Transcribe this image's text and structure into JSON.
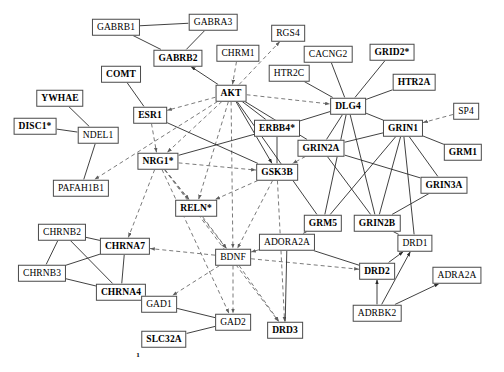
{
  "diagram": {
    "background": "#ffffff",
    "node_border_color": "#4a4a4a",
    "solid_edge_color": "#2b2b2b",
    "dashed_edge_color": "#6b6b6b",
    "annotation": "1",
    "annotation_x": 138,
    "annotation_y": 355
  },
  "nodes": [
    {
      "id": "GABRB1",
      "label": "GABRB1",
      "x": 116,
      "y": 27,
      "bold": false
    },
    {
      "id": "GABRA3",
      "label": "GABRA3",
      "x": 213,
      "y": 22,
      "bold": false
    },
    {
      "id": "RGS4",
      "label": "RGS4",
      "x": 288,
      "y": 33,
      "bold": false
    },
    {
      "id": "GABRB2",
      "label": "GABRB2",
      "x": 178,
      "y": 58,
      "bold": true
    },
    {
      "id": "CHRM1",
      "label": "CHRM1",
      "x": 238,
      "y": 53,
      "bold": false
    },
    {
      "id": "CACNG2",
      "label": "CACNG2",
      "x": 328,
      "y": 54,
      "bold": false
    },
    {
      "id": "GRID2",
      "label": "GRID2*",
      "x": 392,
      "y": 52,
      "bold": true
    },
    {
      "id": "COMT",
      "label": "COMT",
      "x": 121,
      "y": 74,
      "bold": true
    },
    {
      "id": "HTR2C",
      "label": "HTR2C",
      "x": 289,
      "y": 73,
      "bold": false
    },
    {
      "id": "HTR2A",
      "label": "HTR2A",
      "x": 414,
      "y": 82,
      "bold": true
    },
    {
      "id": "YWHAE",
      "label": "YWHAE",
      "x": 60,
      "y": 98,
      "bold": true
    },
    {
      "id": "AKT",
      "label": "AKT",
      "x": 231,
      "y": 93,
      "bold": true
    },
    {
      "id": "DLG4",
      "label": "DLG4",
      "x": 348,
      "y": 106,
      "bold": true
    },
    {
      "id": "SP4",
      "label": "SP4",
      "x": 466,
      "y": 111,
      "bold": false
    },
    {
      "id": "ESR1",
      "label": "ESR1",
      "x": 150,
      "y": 115,
      "bold": true
    },
    {
      "id": "ERBB4",
      "label": "ERBB4*",
      "x": 277,
      "y": 128,
      "bold": true
    },
    {
      "id": "GRIN1",
      "label": "GRIN1",
      "x": 403,
      "y": 128,
      "bold": true
    },
    {
      "id": "DISC1",
      "label": "DISC1*",
      "x": 35,
      "y": 126,
      "bold": true
    },
    {
      "id": "NDEL1",
      "label": "NDEL1",
      "x": 98,
      "y": 135,
      "bold": false
    },
    {
      "id": "GRIN2A",
      "label": "GRIN2A",
      "x": 321,
      "y": 148,
      "bold": true
    },
    {
      "id": "GRM1",
      "label": "GRM1",
      "x": 463,
      "y": 152,
      "bold": true
    },
    {
      "id": "NRG1",
      "label": "NRG1*",
      "x": 158,
      "y": 161,
      "bold": true
    },
    {
      "id": "GSK3B",
      "label": "GSK3B",
      "x": 277,
      "y": 172,
      "bold": true
    },
    {
      "id": "GRIN3A",
      "label": "GRIN3A",
      "x": 444,
      "y": 185,
      "bold": true
    },
    {
      "id": "PAFAH1B1",
      "label": "PAFAH1B1",
      "x": 81,
      "y": 188,
      "bold": false
    },
    {
      "id": "RELN",
      "label": "RELN*",
      "x": 196,
      "y": 208,
      "bold": true
    },
    {
      "id": "GRM5",
      "label": "GRM5",
      "x": 323,
      "y": 223,
      "bold": true
    },
    {
      "id": "GRIN2B",
      "label": "GRIN2B",
      "x": 377,
      "y": 223,
      "bold": true
    },
    {
      "id": "CHRNB2",
      "label": "CHRNB2",
      "x": 62,
      "y": 232,
      "bold": false
    },
    {
      "id": "ADORA2A",
      "label": "ADORA2A",
      "x": 287,
      "y": 242,
      "bold": false
    },
    {
      "id": "DRD1",
      "label": "DRD1",
      "x": 415,
      "y": 243,
      "bold": false
    },
    {
      "id": "CHRNA7",
      "label": "CHRNA7",
      "x": 125,
      "y": 246,
      "bold": true
    },
    {
      "id": "BDNF",
      "label": "BDNF",
      "x": 233,
      "y": 257,
      "bold": false
    },
    {
      "id": "CHRNB3",
      "label": "CHRNB3",
      "x": 42,
      "y": 273,
      "bold": false
    },
    {
      "id": "DRD2",
      "label": "DRD2",
      "x": 377,
      "y": 271,
      "bold": true
    },
    {
      "id": "ADRA2A",
      "label": "ADRA2A",
      "x": 457,
      "y": 275,
      "bold": false
    },
    {
      "id": "CHRNA4",
      "label": "CHRNA4",
      "x": 121,
      "y": 292,
      "bold": true
    },
    {
      "id": "GAD1",
      "label": "GAD1",
      "x": 159,
      "y": 304,
      "bold": false
    },
    {
      "id": "ADRBK2",
      "label": "ADRBK2",
      "x": 377,
      "y": 313,
      "bold": false
    },
    {
      "id": "GAD2",
      "label": "GAD2",
      "x": 233,
      "y": 322,
      "bold": false
    },
    {
      "id": "DRD3",
      "label": "DRD3",
      "x": 285,
      "y": 330,
      "bold": true
    },
    {
      "id": "SLC32A",
      "label": "SLC32A",
      "x": 164,
      "y": 339,
      "bold": true
    }
  ],
  "edges": [
    {
      "from": "GABRB1",
      "to": "GABRA3",
      "style": "solid",
      "arrow": "none"
    },
    {
      "from": "GABRB1",
      "to": "GABRB2",
      "style": "solid",
      "arrow": "none"
    },
    {
      "from": "GABRA3",
      "to": "GABRB2",
      "style": "solid",
      "arrow": "none"
    },
    {
      "from": "AKT",
      "to": "GABRB2",
      "style": "solid",
      "arrow": "to"
    },
    {
      "from": "CHRM1",
      "to": "AKT",
      "style": "dashed",
      "arrow": "to"
    },
    {
      "from": "AKT",
      "to": "RGS4",
      "style": "dashed",
      "arrow": "to"
    },
    {
      "from": "COMT",
      "to": "ESR1",
      "style": "solid",
      "arrow": "none"
    },
    {
      "from": "AKT",
      "to": "ESR1",
      "style": "dashed",
      "arrow": "to"
    },
    {
      "from": "AKT",
      "to": "DLG4",
      "style": "dashed",
      "arrow": "to"
    },
    {
      "from": "AKT",
      "to": "ERBB4",
      "style": "solid",
      "arrow": "none"
    },
    {
      "from": "AKT",
      "to": "GSK3B",
      "style": "solid",
      "arrow": "to"
    },
    {
      "from": "AKT",
      "to": "NRG1",
      "style": "dashed",
      "arrow": "to"
    },
    {
      "from": "AKT",
      "to": "BDNF",
      "style": "dashed",
      "arrow": "to"
    },
    {
      "from": "AKT",
      "to": "GRIN2A",
      "style": "solid",
      "arrow": "none"
    },
    {
      "from": "AKT",
      "to": "RELN",
      "style": "dashed",
      "arrow": "to"
    },
    {
      "from": "AKT",
      "to": "GRM5",
      "style": "solid",
      "arrow": "none"
    },
    {
      "from": "AKT",
      "to": "PAFAH1B1",
      "style": "dashed",
      "arrow": "to"
    },
    {
      "from": "YWHAE",
      "to": "NDEL1",
      "style": "solid",
      "arrow": "none"
    },
    {
      "from": "DISC1",
      "to": "NDEL1",
      "style": "solid",
      "arrow": "none"
    },
    {
      "from": "NDEL1",
      "to": "PAFAH1B1",
      "style": "solid",
      "arrow": "none"
    },
    {
      "from": "ESR1",
      "to": "NRG1",
      "style": "dashed",
      "arrow": "to"
    },
    {
      "from": "ESR1",
      "to": "GSK3B",
      "style": "solid",
      "arrow": "none"
    },
    {
      "from": "NRG1",
      "to": "ERBB4",
      "style": "solid",
      "arrow": "none"
    },
    {
      "from": "NRG1",
      "to": "GSK3B",
      "style": "dashed",
      "arrow": "to"
    },
    {
      "from": "NRG1",
      "to": "CHRNA7",
      "style": "dashed",
      "arrow": "to"
    },
    {
      "from": "NRG1",
      "to": "BDNF",
      "style": "dashed",
      "arrow": "to"
    },
    {
      "from": "NRG1",
      "to": "GAD2",
      "style": "dashed",
      "arrow": "to"
    },
    {
      "from": "NRG1",
      "to": "DRD3",
      "style": "dashed",
      "arrow": "to"
    },
    {
      "from": "NRG1",
      "to": "RELN",
      "style": "dashed",
      "arrow": "to"
    },
    {
      "from": "ERBB4",
      "to": "DLG4",
      "style": "solid",
      "arrow": "none"
    },
    {
      "from": "ERBB4",
      "to": "GSK3B",
      "style": "solid",
      "arrow": "none"
    },
    {
      "from": "CACNG2",
      "to": "DLG4",
      "style": "solid",
      "arrow": "none"
    },
    {
      "from": "GRID2",
      "to": "DLG4",
      "style": "solid",
      "arrow": "none"
    },
    {
      "from": "HTR2C",
      "to": "DLG4",
      "style": "solid",
      "arrow": "none"
    },
    {
      "from": "HTR2A",
      "to": "DLG4",
      "style": "solid",
      "arrow": "none"
    },
    {
      "from": "DLG4",
      "to": "GRIN1",
      "style": "solid",
      "arrow": "none"
    },
    {
      "from": "DLG4",
      "to": "GRIN2A",
      "style": "solid",
      "arrow": "none"
    },
    {
      "from": "DLG4",
      "to": "GRIN2B",
      "style": "solid",
      "arrow": "none"
    },
    {
      "from": "DLG4",
      "to": "GRM5",
      "style": "solid",
      "arrow": "none"
    },
    {
      "from": "SP4",
      "to": "GRIN1",
      "style": "dashed",
      "arrow": "to"
    },
    {
      "from": "GRIN1",
      "to": "GRM1",
      "style": "solid",
      "arrow": "none"
    },
    {
      "from": "GRIN1",
      "to": "GRIN2A",
      "style": "solid",
      "arrow": "none"
    },
    {
      "from": "GRIN1",
      "to": "GRIN3A",
      "style": "solid",
      "arrow": "none"
    },
    {
      "from": "GRIN1",
      "to": "GRIN2B",
      "style": "solid",
      "arrow": "none"
    },
    {
      "from": "GRIN1",
      "to": "GRM5",
      "style": "solid",
      "arrow": "none"
    },
    {
      "from": "GRIN1",
      "to": "DRD1",
      "style": "solid",
      "arrow": "none"
    },
    {
      "from": "GRIN2A",
      "to": "GRIN3A",
      "style": "solid",
      "arrow": "none"
    },
    {
      "from": "GRIN2A",
      "to": "GRIN2B",
      "style": "solid",
      "arrow": "none"
    },
    {
      "from": "GRIN2A",
      "to": "GSK3B",
      "style": "dashed",
      "arrow": "to"
    },
    {
      "from": "GRIN3A",
      "to": "GRIN2B",
      "style": "solid",
      "arrow": "none"
    },
    {
      "from": "GRIN2B",
      "to": "DRD1",
      "style": "solid",
      "arrow": "none"
    },
    {
      "from": "GSK3B",
      "to": "BDNF",
      "style": "dashed",
      "arrow": "to"
    },
    {
      "from": "GSK3B",
      "to": "RELN",
      "style": "dashed",
      "arrow": "to"
    },
    {
      "from": "GSK3B",
      "to": "DRD3",
      "style": "dashed",
      "arrow": "to"
    },
    {
      "from": "RELN",
      "to": "BDNF",
      "style": "dashed",
      "arrow": "to"
    },
    {
      "from": "CHRNB2",
      "to": "CHRNA7",
      "style": "solid",
      "arrow": "none"
    },
    {
      "from": "CHRNB2",
      "to": "CHRNB3",
      "style": "solid",
      "arrow": "none"
    },
    {
      "from": "CHRNB2",
      "to": "CHRNA4",
      "style": "solid",
      "arrow": "none"
    },
    {
      "from": "CHRNB3",
      "to": "CHRNA7",
      "style": "solid",
      "arrow": "none"
    },
    {
      "from": "CHRNB3",
      "to": "CHRNA4",
      "style": "solid",
      "arrow": "none"
    },
    {
      "from": "CHRNA7",
      "to": "CHRNA4",
      "style": "solid",
      "arrow": "none"
    },
    {
      "from": "BDNF",
      "to": "CHRNA7",
      "style": "dashed",
      "arrow": "to"
    },
    {
      "from": "BDNF",
      "to": "GAD1",
      "style": "dashed",
      "arrow": "to"
    },
    {
      "from": "BDNF",
      "to": "GAD2",
      "style": "dashed",
      "arrow": "to"
    },
    {
      "from": "BDNF",
      "to": "DRD3",
      "style": "dashed",
      "arrow": "to"
    },
    {
      "from": "BDNF",
      "to": "DRD2",
      "style": "dashed",
      "arrow": "to"
    },
    {
      "from": "ADORA2A",
      "to": "BDNF",
      "style": "dashed",
      "arrow": "to"
    },
    {
      "from": "GRM5",
      "to": "ADORA2A",
      "style": "solid",
      "arrow": "none"
    },
    {
      "from": "ADORA2A",
      "to": "DRD2",
      "style": "solid",
      "arrow": "none"
    },
    {
      "from": "ADORA2A",
      "to": "DRD3",
      "style": "solid",
      "arrow": "none"
    },
    {
      "from": "DRD2",
      "to": "DRD1",
      "style": "solid",
      "arrow": "to"
    },
    {
      "from": "ADRBK2",
      "to": "DRD2",
      "style": "solid",
      "arrow": "to"
    },
    {
      "from": "ADRBK2",
      "to": "DRD1",
      "style": "solid",
      "arrow": "to"
    },
    {
      "from": "ADRBK2",
      "to": "ADRA2A",
      "style": "solid",
      "arrow": "to"
    },
    {
      "from": "GAD1",
      "to": "GAD2",
      "style": "solid",
      "arrow": "none"
    },
    {
      "from": "SLC32A",
      "to": "GAD2",
      "style": "solid",
      "arrow": "none"
    }
  ]
}
